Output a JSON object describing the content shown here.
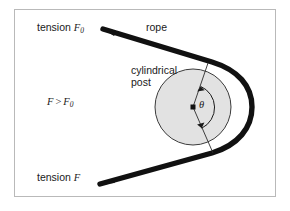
{
  "figure": {
    "frame": {
      "border_color": "#b9b9b9",
      "background": "#ffffff"
    },
    "labels": {
      "tension_f0": {
        "prefix": "tension ",
        "symbol": "F",
        "subscript": "0"
      },
      "rope": "rope",
      "cylindrical_post_line1": "cylindrical",
      "cylindrical_post_line2": "post",
      "inequality": {
        "left": "F",
        "operator": ">",
        "right": "F",
        "right_subscript": "0"
      },
      "tension_f": {
        "prefix": "tension ",
        "symbol": "F"
      },
      "angle": "θ"
    },
    "colors": {
      "rope": "#111111",
      "post_fill": "#e2e2e2",
      "post_stroke": "#3b3b3b",
      "radius_line": "#2b2b2b",
      "arc_arrow": "#1a1a1a",
      "text": "#1a1a1a"
    },
    "geometry": {
      "post_center_x": 193,
      "post_center_y": 107,
      "post_radius": 38,
      "rope_thickness": 5,
      "angle_arc_radius": 22,
      "upper_tangent": {
        "x": 208,
        "y": 64
      },
      "lower_tangent": {
        "x": 213,
        "y": 152
      },
      "upper_rope_start": {
        "x": 103,
        "y": 29
      },
      "lower_rope_start": {
        "x": 100,
        "y": 184
      }
    }
  }
}
